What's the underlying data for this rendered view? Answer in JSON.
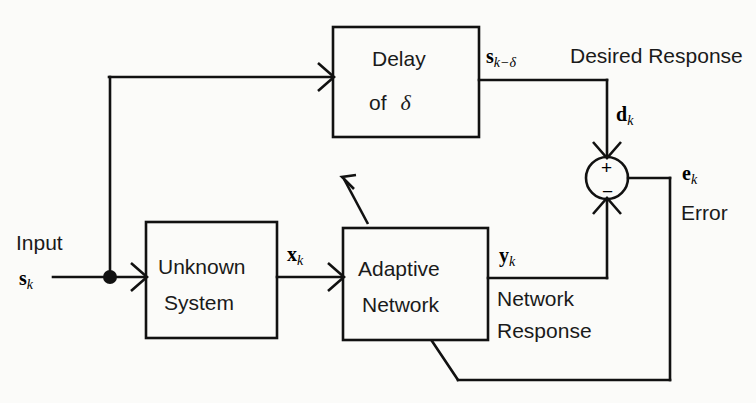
{
  "figure": {
    "type": "block-diagram",
    "background_color": "#fbfbf9",
    "line_color": "#111111"
  },
  "blocks": {
    "delay": {
      "line1": "Delay",
      "line2_prefix": "of",
      "line2_symbol": "δ"
    },
    "unknown_system": {
      "line1": "Unknown",
      "line2": "System"
    },
    "adaptive_network": {
      "line1": "Adaptive",
      "line2": "Network"
    }
  },
  "signals": {
    "input_caption": "Input",
    "input_symbol": "s",
    "input_subscript": "k",
    "delay_out_symbol": "s",
    "delay_out_subscript": "k−δ",
    "desired_response_caption": "Desired Response",
    "d_symbol": "d",
    "d_subscript": "k",
    "x_symbol": "x",
    "x_subscript": "k",
    "y_symbol": "y",
    "y_subscript": "k",
    "network_response_line1": "Network",
    "network_response_line2": "Response",
    "e_symbol": "e",
    "e_subscript": "k",
    "error_caption": "Error"
  },
  "summing_junction": {
    "plus_sign": "+",
    "minus_sign": "−",
    "inputs": [
      "d_k (+)",
      "y_k (−)"
    ],
    "output": "e_k"
  }
}
